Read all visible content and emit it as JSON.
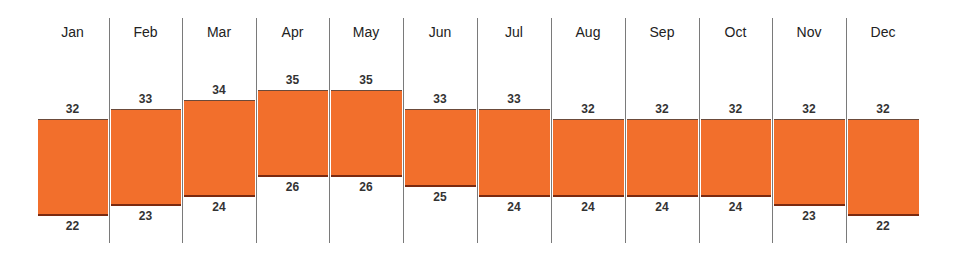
{
  "chart_data": {
    "type": "floating-bar",
    "title": "",
    "xlabel": "",
    "ylabel": "",
    "categories": [
      "Jan",
      "Feb",
      "Mar",
      "Apr",
      "May",
      "Jun",
      "Jul",
      "Aug",
      "Sep",
      "Oct",
      "Nov",
      "Dec"
    ],
    "series": [
      {
        "name": "High",
        "values": [
          32,
          33,
          34,
          35,
          35,
          33,
          33,
          32,
          32,
          32,
          32,
          32
        ]
      },
      {
        "name": "Low",
        "values": [
          22,
          23,
          24,
          26,
          26,
          25,
          24,
          24,
          24,
          24,
          23,
          22
        ]
      }
    ],
    "bar_color": "#f26f2c",
    "grid": false,
    "legend": "none"
  }
}
